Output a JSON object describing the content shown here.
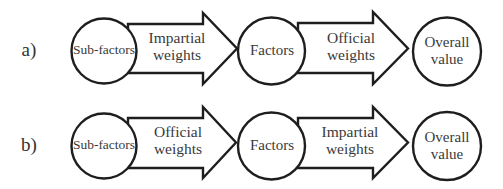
{
  "diagram": {
    "type": "flow",
    "colors": {
      "stroke": "#1e1e1e",
      "text": "#3a3a3a",
      "background": "#ffffff"
    },
    "rows": [
      {
        "label": "a)",
        "nodes": [
          "Sub-factors",
          "Factors",
          "Overall value"
        ],
        "node_lines": [
          [
            "Sub-factors"
          ],
          [
            "Factors"
          ],
          [
            "Overall",
            "value"
          ]
        ],
        "edges": [
          {
            "from": "Sub-factors",
            "to": "Factors",
            "label": "Impartial weights",
            "lines": [
              "Impartial",
              "weights"
            ]
          },
          {
            "from": "Factors",
            "to": "Overall value",
            "label": "Official weights",
            "lines": [
              "Official",
              "weights"
            ]
          }
        ]
      },
      {
        "label": "b)",
        "nodes": [
          "Sub-factors",
          "Factors",
          "Overall value"
        ],
        "node_lines": [
          [
            "Sub-factors"
          ],
          [
            "Factors"
          ],
          [
            "Overall",
            "value"
          ]
        ],
        "edges": [
          {
            "from": "Sub-factors",
            "to": "Factors",
            "label": "Official weights",
            "lines": [
              "Official",
              "weights"
            ]
          },
          {
            "from": "Factors",
            "to": "Overall value",
            "label": "Impartial weights",
            "lines": [
              "Impartial",
              "weights"
            ]
          }
        ]
      }
    ]
  }
}
